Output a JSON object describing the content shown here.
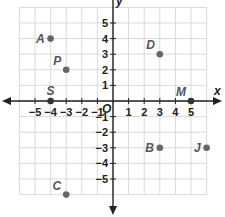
{
  "plane": {
    "x_min": -6,
    "x_max": 6,
    "y_min": -6,
    "y_max": 6,
    "x_label": "x",
    "y_label": "y",
    "origin_label": "O",
    "x_ticks": [
      {
        "v": -5,
        "label": "−5"
      },
      {
        "v": -4,
        "label": "−4"
      },
      {
        "v": -3,
        "label": "−3"
      },
      {
        "v": -2,
        "label": "−2"
      },
      {
        "v": -1,
        "label": "−1"
      },
      {
        "v": 1,
        "label": "1"
      },
      {
        "v": 2,
        "label": "2"
      },
      {
        "v": 3,
        "label": "3"
      },
      {
        "v": 4,
        "label": "4"
      },
      {
        "v": 5,
        "label": "5"
      }
    ],
    "y_ticks": [
      {
        "v": 5,
        "label": "5"
      },
      {
        "v": 4,
        "label": "4"
      },
      {
        "v": 3,
        "label": "3"
      },
      {
        "v": 2,
        "label": "2"
      },
      {
        "v": 1,
        "label": "1"
      },
      {
        "v": -1,
        "label": "−1"
      },
      {
        "v": -2,
        "label": "−2"
      },
      {
        "v": -3,
        "label": "−3"
      },
      {
        "v": -4,
        "label": "−4"
      },
      {
        "v": -5,
        "label": "−5"
      }
    ]
  },
  "points": [
    {
      "name": "A",
      "x": -4,
      "y": 4,
      "label_side": "left"
    },
    {
      "name": "P",
      "x": -3,
      "y": 2,
      "label_side": "upleft"
    },
    {
      "name": "S",
      "x": -4,
      "y": 0,
      "label_side": "above"
    },
    {
      "name": "D",
      "x": 3,
      "y": 3,
      "label_side": "upleft"
    },
    {
      "name": "M",
      "x": 5,
      "y": 0,
      "label_side": "upleft"
    },
    {
      "name": "B",
      "x": 3,
      "y": -3,
      "label_side": "left"
    },
    {
      "name": "J",
      "x": 6,
      "y": -3,
      "label_side": "left"
    },
    {
      "name": "C",
      "x": -3,
      "y": -6,
      "label_side": "upleft"
    }
  ],
  "colors": {
    "grid": "#d9d9d9",
    "axis": "#222222",
    "point": "#666666",
    "axis_point": "#333333"
  }
}
